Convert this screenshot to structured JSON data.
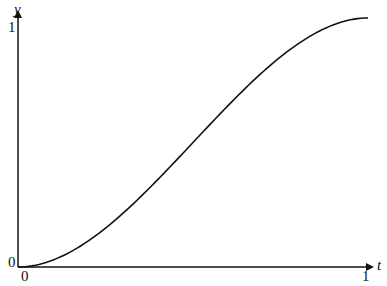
{
  "chart_data": {
    "type": "line",
    "title": "",
    "xlabel": "t",
    "ylabel": "y",
    "xlim": [
      0,
      1
    ],
    "ylim": [
      0,
      1
    ],
    "x_ticks": [
      "0",
      "1"
    ],
    "y_ticks": [
      "0",
      "1"
    ],
    "grid": false,
    "legend": null,
    "series": [
      {
        "name": "curve",
        "description": "smooth S-shaped curve from (0,0) to (1,1), flat at both ends",
        "x": [
          0,
          0.1,
          0.2,
          0.3,
          0.4,
          0.5,
          0.6,
          0.7,
          0.8,
          0.9,
          1.0
        ],
        "y": [
          0,
          0.028,
          0.104,
          0.216,
          0.352,
          0.5,
          0.648,
          0.784,
          0.896,
          0.972,
          1.0
        ]
      }
    ]
  },
  "axes": {
    "x_label": "t",
    "y_label": "y",
    "x_origin_label": "0",
    "x_end_label": "1",
    "y_origin_label": "0",
    "y_end_label": "1"
  },
  "colors": {
    "line": "#111111",
    "axis": "#111111",
    "background": "#ffffff"
  }
}
